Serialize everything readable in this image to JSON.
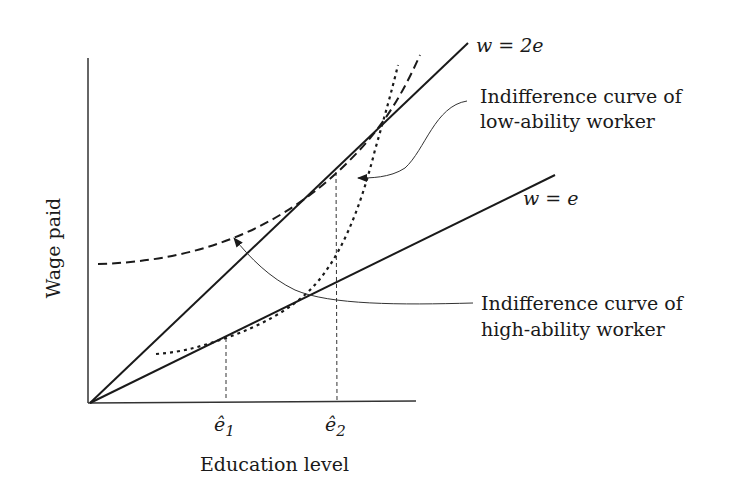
{
  "diagram": {
    "type": "economics-signaling-diagram",
    "axes": {
      "x_label": "Education level",
      "y_label": "Wage paid"
    },
    "lines": [
      {
        "id": "w2e",
        "label": "w = 2e",
        "style": "solid"
      },
      {
        "id": "we",
        "label": "w = e",
        "style": "solid"
      }
    ],
    "ticks": [
      {
        "id": "e1",
        "label": "ê",
        "subscript": "1"
      },
      {
        "id": "e2",
        "label": "ê",
        "subscript": "2"
      }
    ],
    "curves": [
      {
        "id": "high",
        "style": "dashed",
        "description": "Indifference curve of high-ability worker"
      },
      {
        "id": "low",
        "style": "dotted",
        "description": "Indifference curve of low-ability worker"
      }
    ],
    "annotations": {
      "low_line1": "Indifference curve of",
      "low_line2": "low-ability worker",
      "high_line1": "Indifference curve of",
      "high_line2": "high-ability worker"
    },
    "colors": {
      "ink": "#1a1a1a",
      "background": "#ffffff"
    }
  }
}
